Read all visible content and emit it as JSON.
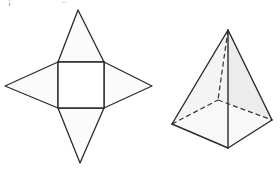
{
  "page": {
    "width": 280,
    "height": 170,
    "background_color": "#ffffff"
  },
  "style": {
    "stroke_color": "#2b2b2b",
    "stroke_color_light": "#4a4a4a",
    "net_fill": "#fbfbfb",
    "face_fill_light": "#f7f7f7",
    "face_fill_mid": "#f1f1f1",
    "face_fill_shade": "#ebebeb",
    "dashed_stroke_color": "#3a3a3a",
    "stroke_width": 1.3,
    "dash_pattern": "5,3"
  },
  "figures": [
    {
      "id": "net",
      "name": "square-pyramid-net",
      "label": "",
      "description": "Plane net of a square pyramid: central square with four congruent isosceles triangles attached to each side",
      "geometry": {
        "square": [
          [
            58,
            62
          ],
          [
            104,
            62
          ],
          [
            104,
            108
          ],
          [
            58,
            108
          ]
        ],
        "triangle_top_apex": [
          78,
          10
        ],
        "triangle_bottom_apex": [
          80,
          163
        ],
        "triangle_left_apex": [
          5,
          86
        ],
        "triangle_right_apex": [
          152,
          86
        ]
      },
      "face_count": 5,
      "triangle_count": 4,
      "square_count": 1
    },
    {
      "id": "solid",
      "name": "square-pyramid-solid",
      "label": "",
      "description": "Three dimensional square pyramid drawn in oblique view with hidden base edges and hidden lateral edge shown dashed",
      "geometry": {
        "apex": [
          228,
          30
        ],
        "base_front": [
          228,
          148
        ],
        "base_left": [
          172,
          124
        ],
        "base_right": [
          272,
          120
        ],
        "base_back_hidden": [
          218,
          100
        ]
      },
      "visible_edges": [
        "apex-base_left",
        "apex-base_front",
        "apex-base_right",
        "base_left-base_front",
        "base_front-base_right"
      ],
      "hidden_edges": [
        "apex-base_back_hidden",
        "base_left-base_back_hidden",
        "base_right-base_back_hidden"
      ],
      "vertex_count": 5,
      "edge_count": 8,
      "face_count": 5
    }
  ],
  "artifacts": {
    "top_clipped_text": [
      {
        "text": "¡",
        "x": 8,
        "y": -3
      },
      {
        "text": "..",
        "x": 62,
        "y": -4
      },
      {
        "text": "¨",
        "x": 92,
        "y": -4
      }
    ]
  }
}
